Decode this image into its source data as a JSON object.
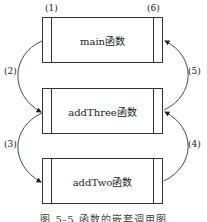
{
  "diagram": {
    "title": "函数的嵌套调用",
    "nodes": [
      {
        "id": "main",
        "label": "main函数"
      },
      {
        "id": "addThree",
        "label": "addThree函数"
      },
      {
        "id": "addTwo",
        "label": "addTwo函数"
      }
    ],
    "steps": [
      {
        "label": "(1)",
        "meaning": "start of main"
      },
      {
        "label": "(2)",
        "from": "main",
        "to": "addThree"
      },
      {
        "label": "(3)",
        "from": "addThree",
        "to": "addTwo"
      },
      {
        "label": "(4)",
        "from": "addTwo",
        "to": "addThree"
      },
      {
        "label": "(5)",
        "from": "addThree",
        "to": "main"
      },
      {
        "label": "(6)",
        "meaning": "end of main"
      }
    ],
    "caption": "图 5-5  函数的嵌套调用图"
  }
}
